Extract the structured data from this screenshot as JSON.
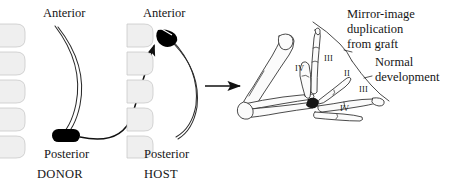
{
  "figure": {
    "background_color": "#ffffff",
    "ink_color": "#161616",
    "graft_color": "#000000",
    "somite_fill": "#efefef",
    "width": 457,
    "height": 190
  },
  "donor": {
    "anterior_label": "Anterior",
    "posterior_label": "Posterior",
    "caption": "DONOR",
    "somite_count": 5,
    "graft_label": "ZPA graft tissue",
    "graft_position": "posterior"
  },
  "host": {
    "anterior_label": "Anterior",
    "posterior_label": "Posterior",
    "caption": "HOST",
    "somite_count": 5,
    "graft_label": "grafted ZPA tissue",
    "graft_position": "anterior"
  },
  "transfer_arrow": {
    "label": "graft transfer path"
  },
  "result_arrow": {
    "label": "develops into"
  },
  "limb": {
    "callouts": [
      {
        "id": "mirror",
        "lines": "Mirror-image\nduplication\nfrom graft"
      },
      {
        "id": "normal",
        "lines": "Normal\ndevelopment"
      }
    ],
    "digits": [
      {
        "id": "iv-upper",
        "label": "IV",
        "group": "mirror"
      },
      {
        "id": "iii-upper",
        "label": "III",
        "group": "mirror"
      },
      {
        "id": "ii",
        "label": "II",
        "group": "normal"
      },
      {
        "id": "iii-lower",
        "label": "III",
        "group": "normal"
      },
      {
        "id": "iv-lower",
        "label": "IV",
        "group": "normal"
      }
    ]
  }
}
